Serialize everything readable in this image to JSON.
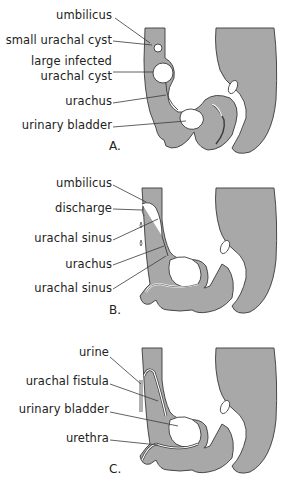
{
  "figure": {
    "fill_color": "#a8a8a8",
    "outline_color": "#3a3a3a",
    "panels": [
      {
        "id": "A",
        "letter": "A.",
        "labels": [
          {
            "text": "umbilicus"
          },
          {
            "text": "small urachal cyst"
          },
          {
            "text": "large infected"
          },
          {
            "text": "urachal cyst"
          },
          {
            "text": "urachus"
          },
          {
            "text": "urinary bladder"
          }
        ]
      },
      {
        "id": "B",
        "letter": "B.",
        "labels": [
          {
            "text": "umbilicus"
          },
          {
            "text": "discharge"
          },
          {
            "text": "urachal sinus"
          },
          {
            "text": "urachus"
          },
          {
            "text": "urachal sinus"
          }
        ]
      },
      {
        "id": "C",
        "letter": "C.",
        "labels": [
          {
            "text": "urine"
          },
          {
            "text": "urachal fistula"
          },
          {
            "text": "urinary bladder"
          },
          {
            "text": "urethra"
          }
        ]
      }
    ]
  }
}
